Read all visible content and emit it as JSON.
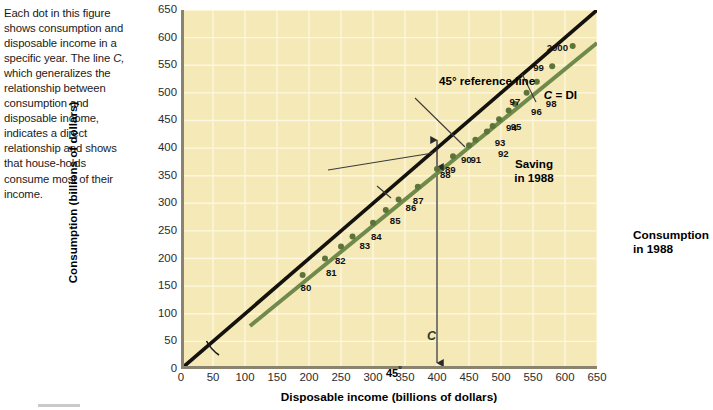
{
  "caption": {
    "part1": "Each dot in this figure shows consumption and disposable income in a specific year. The line ",
    "italic": "C,",
    "part2": " which generalizes the relationship between consumption and disposable income, indicates a direct relationship and shows that house-holds consume most of their income."
  },
  "chart_data": {
    "type": "scatter",
    "title": "",
    "xlabel": "Disposable income (billions of dollars)",
    "ylabel": "Consumption (billions of dollars)",
    "xlim": [
      0,
      650
    ],
    "ylim": [
      0,
      650
    ],
    "xticks": [
      0,
      50,
      100,
      150,
      200,
      250,
      300,
      350,
      400,
      450,
      500,
      550,
      600,
      650
    ],
    "yticks": [
      0,
      50,
      100,
      150,
      200,
      250,
      300,
      350,
      400,
      450,
      500,
      550,
      600,
      650
    ],
    "grid": true,
    "legend": "none",
    "plot_background": "#f6e9b8",
    "gridline_color": "#fdf7df",
    "series": [
      {
        "name": "45-degree reference line",
        "type": "line",
        "color": "#14120c",
        "x": [
          0,
          650
        ],
        "y": [
          0,
          650
        ]
      },
      {
        "name": "C (consumption line)",
        "type": "line",
        "color": "#6f8a4a",
        "x": [
          108,
          650
        ],
        "y": [
          78,
          590
        ]
      },
      {
        "name": "Consumption and disposable income by year",
        "type": "scatter",
        "color": "#5c7339",
        "points": [
          {
            "label": "80",
            "x": 190,
            "y": 170
          },
          {
            "label": "81",
            "x": 225,
            "y": 200
          },
          {
            "label": "82",
            "x": 250,
            "y": 222
          },
          {
            "label": "83",
            "x": 268,
            "y": 240
          },
          {
            "label": "84",
            "x": 300,
            "y": 265
          },
          {
            "label": "85",
            "x": 320,
            "y": 288
          },
          {
            "label": "86",
            "x": 340,
            "y": 307
          },
          {
            "label": "87",
            "x": 370,
            "y": 330
          },
          {
            "label": "88",
            "x": 400,
            "y": 362
          },
          {
            "label": "89",
            "x": 425,
            "y": 385
          },
          {
            "label": "90",
            "x": 450,
            "y": 405
          },
          {
            "label": "91",
            "x": 460,
            "y": 415
          },
          {
            "label": "92",
            "x": 478,
            "y": 430
          },
          {
            "label": "93",
            "x": 487,
            "y": 440
          },
          {
            "label": "94",
            "x": 497,
            "y": 452
          },
          {
            "label": "95",
            "x": 512,
            "y": 468
          },
          {
            "label": "96",
            "x": 522,
            "y": 480
          },
          {
            "label": "97",
            "x": 540,
            "y": 500
          },
          {
            "label": "98",
            "x": 556,
            "y": 520
          },
          {
            "label": "99",
            "x": 580,
            "y": 548
          },
          {
            "label": "2000",
            "x": 612,
            "y": 585
          }
        ]
      }
    ],
    "annotations": [
      {
        "name": "reference-line-label",
        "line1": "45° reference line",
        "line2_italic": "C",
        "line2_rest": " = DI"
      },
      {
        "name": "saving-label",
        "line1": "Saving",
        "line2": "in 1988"
      },
      {
        "name": "consumption-label",
        "line1": "Consumption",
        "line2": "in 1988"
      },
      {
        "name": "angle-label",
        "text": "45",
        "degree": "°"
      },
      {
        "name": "c-line-label",
        "text": "C"
      }
    ]
  }
}
